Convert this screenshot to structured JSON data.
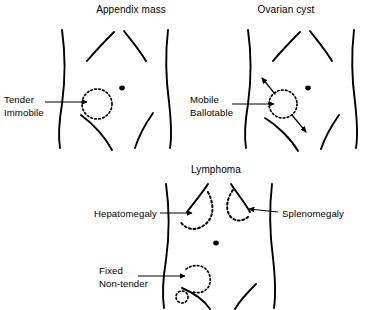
{
  "figure": {
    "background_color": "#ffffff",
    "line_color": "#000000",
    "panel_count": 3
  },
  "panels": [
    {
      "id": "appendix-mass",
      "title": "Appendix mass",
      "title_x": 131,
      "title_y": 13,
      "labels": [
        {
          "id": "tender",
          "text": "Tender",
          "x": 4,
          "y": 100
        },
        {
          "id": "immobile",
          "text": "Immobile",
          "x": 4,
          "y": 113
        }
      ],
      "mass": {
        "cx": 97,
        "cy": 104,
        "r": 15,
        "style": "dotted"
      },
      "umbilicus": {
        "cx": 122,
        "cy": 88,
        "r": 2.6
      },
      "pointer_arrow": {
        "x1": 45,
        "y1": 102,
        "x2": 92,
        "y2": 102
      }
    },
    {
      "id": "ovarian-cyst",
      "title": "Ovarian cyst",
      "title_x": 283,
      "title_y": 13,
      "labels": [
        {
          "id": "mobile",
          "text": "Mobile",
          "x": 190,
          "y": 100
        },
        {
          "id": "ballotable",
          "text": "Ballotable",
          "x": 190,
          "y": 113
        }
      ],
      "mass": {
        "cx": 283,
        "cy": 104,
        "r": 14,
        "style": "dotted"
      },
      "umbilicus": {
        "cx": 308,
        "cy": 88,
        "r": 2.6
      },
      "pointer_arrow": {
        "x1": 232,
        "y1": 104,
        "x2": 278,
        "y2": 104
      },
      "motion_arrow": {
        "description": "double-headed diagonal arrow through mass",
        "x1": 262,
        "y1": 79,
        "x2": 307,
        "y2": 131
      }
    },
    {
      "id": "lymphoma",
      "title": "Lymphoma",
      "title_x": 186,
      "title_y": 170,
      "labels": [
        {
          "id": "hepatomegaly",
          "text": "Hepatomegaly",
          "x": 85,
          "y": 215
        },
        {
          "id": "splenomegaly",
          "text": "Splenomegaly",
          "x": 280,
          "y": 215
        },
        {
          "id": "fixed",
          "text": "Fixed",
          "x": 99,
          "y": 271
        },
        {
          "id": "non-tender",
          "text": "Non-tender",
          "x": 99,
          "y": 284
        }
      ],
      "umbilicus": {
        "cx": 216,
        "cy": 243,
        "r": 2.6
      },
      "organs": [
        {
          "id": "enlarged-liver",
          "name": "hepatomegaly-outline",
          "side": "left",
          "style": "dotted"
        },
        {
          "id": "enlarged-spleen",
          "name": "splenomegaly-outline",
          "side": "right",
          "style": "dotted"
        }
      ],
      "masses": [
        {
          "id": "pelvic-mass",
          "cx": 195,
          "cy": 278,
          "r": 15,
          "style": "dotted"
        },
        {
          "id": "small-node",
          "cx": 182,
          "cy": 297,
          "r": 6,
          "style": "dotted"
        }
      ],
      "pointer_arrows": [
        {
          "id": "hepatomegaly-arrow",
          "x1": 160,
          "y1": 214,
          "x2": 198,
          "y2": 214
        },
        {
          "id": "splenomegaly-arrow",
          "x1": 277,
          "y1": 214,
          "x2": 243,
          "y2": 211
        },
        {
          "id": "fixed-arrow",
          "x1": 140,
          "y1": 277,
          "x2": 190,
          "y2": 277
        }
      ]
    }
  ]
}
